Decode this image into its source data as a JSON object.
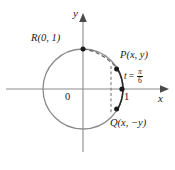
{
  "figure": {
    "type": "unit-circle-diagram",
    "axis_labels": {
      "x": "x",
      "y": "y",
      "origin": "0"
    },
    "tick_labels": {
      "x_one": "1"
    },
    "points": [
      {
        "id": "R",
        "label": "R(0, 1)",
        "x_unit": 0,
        "y_unit": 1
      },
      {
        "id": "P",
        "label": "P(x, y)",
        "x_unit": 0.866,
        "y_unit": 0.5
      },
      {
        "id": "Q",
        "label": "Q(x, −y)",
        "x_unit": 0.866,
        "y_unit": -0.5
      }
    ],
    "arc_annotation": {
      "variable": "t",
      "equals": "=",
      "numerator": "π",
      "denominator": "6",
      "full_text": "t = π/6"
    },
    "colors": {
      "circle": "#8b8b8b",
      "axis": "#8b8b8b",
      "ink": "#1a1a1a",
      "dash": "#6b6b6b",
      "background": "#ffffff"
    },
    "geometry": {
      "center": [
        83,
        89
      ],
      "radius": 40
    }
  }
}
